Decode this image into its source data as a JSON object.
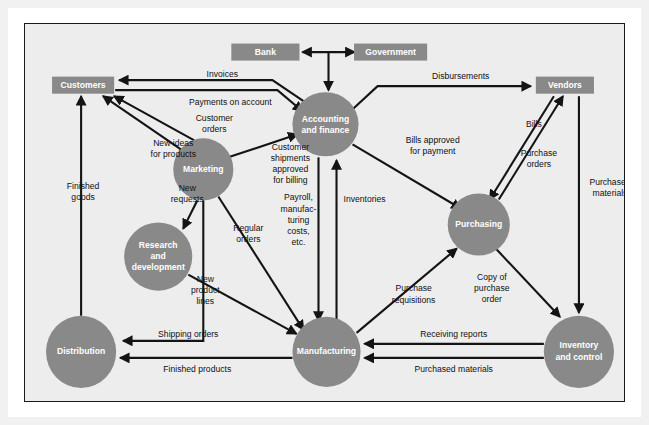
{
  "diagram": {
    "colors": {
      "node_fill": "#898989",
      "node_text": "#ffffff",
      "line": "#141414",
      "background": "#ededed",
      "frame_border": "#1a1a1a",
      "outer_mat": "#f1f1f1"
    },
    "nodes": [
      {
        "id": "bank",
        "label": "Bank",
        "shape": "box",
        "cx": 240,
        "cy": 28,
        "w": 68,
        "h": 17
      },
      {
        "id": "government",
        "label": "Government",
        "shape": "box",
        "cx": 365,
        "cy": 28,
        "w": 73,
        "h": 17
      },
      {
        "id": "customers",
        "label": "Customers",
        "shape": "box",
        "cx": 58,
        "cy": 61,
        "w": 62,
        "h": 17
      },
      {
        "id": "vendors",
        "label": "Vendors",
        "shape": "box",
        "cx": 539,
        "cy": 61,
        "w": 58,
        "h": 17
      },
      {
        "id": "accounting",
        "label": "Accounting\nand finance",
        "shape": "ellipse",
        "cx": 300,
        "cy": 100,
        "rx": 33,
        "ry": 32
      },
      {
        "id": "marketing",
        "label": "Marketing",
        "shape": "ellipse",
        "cx": 178,
        "cy": 145,
        "rx": 30,
        "ry": 31
      },
      {
        "id": "rnd",
        "label": "Research\nand\ndevelopment",
        "shape": "ellipse",
        "cx": 133,
        "cy": 232,
        "rx": 34,
        "ry": 34
      },
      {
        "id": "purchasing",
        "label": "Purchasing",
        "shape": "ellipse",
        "cx": 453,
        "cy": 200,
        "rx": 31,
        "ry": 31
      },
      {
        "id": "distribution",
        "label": "Distribution",
        "shape": "ellipse",
        "cx": 56,
        "cy": 327,
        "rx": 35,
        "ry": 36
      },
      {
        "id": "manufacturing",
        "label": "Manufacturing",
        "shape": "ellipse",
        "cx": 301,
        "cy": 327,
        "rx": 34,
        "ry": 35
      },
      {
        "id": "inventory",
        "label": "Inventory\nand control",
        "shape": "ellipse",
        "cx": 553,
        "cy": 327,
        "rx": 35,
        "ry": 36
      }
    ],
    "edge_labels": [
      {
        "id": "invoices",
        "text": "Invoices",
        "x": 197,
        "y": 51
      },
      {
        "id": "disbursements",
        "text": "Disbursements",
        "x": 435,
        "y": 53
      },
      {
        "id": "payments-on-account",
        "text": "Payments on account",
        "x": 205,
        "y": 79
      },
      {
        "id": "customer-orders",
        "text": "Customer\norders",
        "x": 189,
        "y": 100
      },
      {
        "id": "bills",
        "text": "Bills",
        "x": 508,
        "y": 100
      },
      {
        "id": "new-ideas-for-products",
        "text": "New ideas\nfor products",
        "x": 148,
        "y": 125
      },
      {
        "id": "bills-approved-for-payment",
        "text": "Bills approved\nfor payment",
        "x": 407,
        "y": 122
      },
      {
        "id": "customer-shipments",
        "text": "Customer\nshipments\napproved\nfor billing",
        "x": 265,
        "y": 140
      },
      {
        "id": "purchase-orders",
        "text": "Purchase\norders",
        "x": 513,
        "y": 135
      },
      {
        "id": "new-requests",
        "text": "New\nrequests",
        "x": 162,
        "y": 170
      },
      {
        "id": "finished-goods",
        "text": "Finished\ngoods",
        "x": 58,
        "y": 168
      },
      {
        "id": "purchased-materials-top",
        "text": "Purchased\nmaterials",
        "x": 584,
        "y": 164
      },
      {
        "id": "inventories",
        "text": "Inventories",
        "x": 339,
        "y": 175
      },
      {
        "id": "payroll-costs",
        "text": "Payroll,\nmanufac-\nturing\ncosts,\netc.",
        "x": 273,
        "y": 196
      },
      {
        "id": "regular-orders",
        "text": "Regular\norders",
        "x": 223,
        "y": 210
      },
      {
        "id": "new-product-lines",
        "text": "New\nproduct\nlines",
        "x": 180,
        "y": 266
      },
      {
        "id": "purchase-requisitions",
        "text": "Purchase\nrequisitions",
        "x": 388,
        "y": 270
      },
      {
        "id": "copy-of-purchase-order",
        "text": "Copy of\npurchase\norder",
        "x": 466,
        "y": 264
      },
      {
        "id": "shipping-orders",
        "text": "Shipping orders",
        "x": 163,
        "y": 310
      },
      {
        "id": "receiving-reports",
        "text": "Receiving reports",
        "x": 428,
        "y": 310
      },
      {
        "id": "finished-products",
        "text": "Finished products",
        "x": 172,
        "y": 345
      },
      {
        "id": "purchased-materials-bottom",
        "text": "Purchased materials",
        "x": 428,
        "y": 345
      }
    ],
    "flows": [
      {
        "id": "bank-government",
        "from": "bank",
        "to": "government",
        "label": ""
      },
      {
        "id": "government-accounting",
        "from": "government",
        "to": "accounting",
        "label": ""
      },
      {
        "id": "accounting-customers",
        "from": "accounting",
        "to": "customers",
        "label": "Invoices"
      },
      {
        "id": "customers-accounting",
        "from": "customers",
        "to": "accounting",
        "label": "Payments on account"
      },
      {
        "id": "accounting-vendors",
        "from": "accounting",
        "to": "vendors",
        "label": "Disbursements"
      },
      {
        "id": "customers-marketing",
        "from": "customers",
        "to": "marketing",
        "label": "Customer orders"
      },
      {
        "id": "marketing-customers",
        "from": "marketing",
        "to": "customers",
        "label": "New ideas for products"
      },
      {
        "id": "marketing-accounting",
        "from": "marketing",
        "to": "accounting",
        "label": "Customer shipments approved for billing"
      },
      {
        "id": "marketing-rnd",
        "from": "marketing",
        "to": "rnd",
        "label": "New requests"
      },
      {
        "id": "marketing-manufacturing",
        "from": "marketing",
        "to": "manufacturing",
        "label": "Regular orders"
      },
      {
        "id": "marketing-distribution",
        "from": "marketing",
        "to": "distribution",
        "label": "Shipping orders"
      },
      {
        "id": "accounting-purchasing",
        "from": "accounting",
        "to": "purchasing",
        "label": "Bills approved for payment"
      },
      {
        "id": "vendors-purchasing",
        "from": "vendors",
        "to": "purchasing",
        "label": "Bills"
      },
      {
        "id": "purchasing-vendors",
        "from": "purchasing",
        "to": "vendors",
        "label": "Purchase orders"
      },
      {
        "id": "vendors-inventory",
        "from": "vendors",
        "to": "inventory",
        "label": "Purchased materials"
      },
      {
        "id": "manufacturing-accounting",
        "from": "manufacturing",
        "to": "accounting",
        "label": "Inventories"
      },
      {
        "id": "accounting-manufacturing",
        "from": "accounting",
        "to": "manufacturing",
        "label": "Payroll, manufacturing costs, etc."
      },
      {
        "id": "rnd-manufacturing",
        "from": "rnd",
        "to": "manufacturing",
        "label": "New product lines"
      },
      {
        "id": "manufacturing-purchasing",
        "from": "manufacturing",
        "to": "purchasing",
        "label": "Purchase requisitions"
      },
      {
        "id": "purchasing-inventory",
        "from": "purchasing",
        "to": "inventory",
        "label": "Copy of purchase order"
      },
      {
        "id": "inventory-manufacturing-1",
        "from": "inventory",
        "to": "manufacturing",
        "label": "Receiving reports"
      },
      {
        "id": "inventory-manufacturing-2",
        "from": "inventory",
        "to": "manufacturing",
        "label": "Purchased materials"
      },
      {
        "id": "manufacturing-distribution",
        "from": "manufacturing",
        "to": "distribution",
        "label": "Finished products"
      },
      {
        "id": "distribution-customers",
        "from": "distribution",
        "to": "customers",
        "label": "Finished goods"
      }
    ]
  }
}
